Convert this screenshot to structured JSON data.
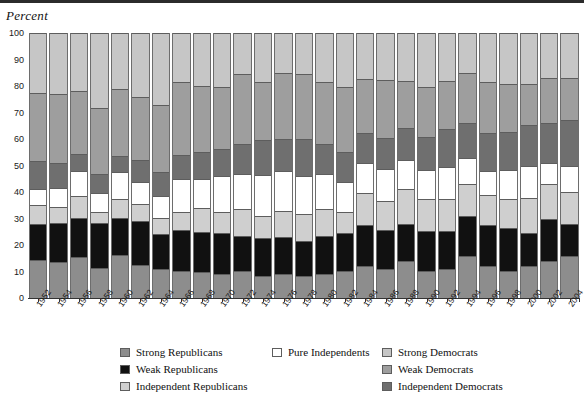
{
  "axis_title": "Percent",
  "legend": {
    "columns": [
      [
        {
          "label": "Strong Republicans",
          "key": "strong_republicans",
          "color": "#8d8d8d"
        },
        {
          "label": "Weak Republicans",
          "key": "weak_republicans",
          "color": "#111111"
        },
        {
          "label": "Independent Republicans",
          "key": "independent_republicans",
          "color": "#cfcfcf"
        }
      ],
      [
        {
          "label": "Pure Independents",
          "key": "pure_independents",
          "color": "#ffffff"
        }
      ],
      [
        {
          "label": "Strong Democrats",
          "key": "strong_democrats",
          "color": "#c6c6c6"
        },
        {
          "label": "Weak Democrats",
          "key": "weak_democrats",
          "color": "#9e9e9e"
        },
        {
          "label": "Independent Democrats",
          "key": "independent_democrats",
          "color": "#6f6f6f"
        }
      ]
    ]
  },
  "chart_data": {
    "type": "bar",
    "subtype": "stacked-100-percent",
    "title": "",
    "xlabel": "",
    "ylabel": "Percent",
    "ylim": [
      0,
      100
    ],
    "yticks": [
      0,
      10,
      20,
      30,
      40,
      50,
      60,
      70,
      80,
      90,
      100
    ],
    "grid": false,
    "legend_position": "bottom",
    "stack_order_bottom_to_top": [
      "strong_republicans",
      "weak_republicans",
      "independent_republicans",
      "pure_independents",
      "independent_democrats",
      "weak_democrats",
      "strong_democrats"
    ],
    "categories": [
      "1952",
      "1954",
      "1956",
      "1958",
      "1960",
      "1962",
      "1964",
      "1966",
      "1968",
      "1970",
      "1972",
      "1974",
      "1976",
      "1978",
      "1980",
      "1982",
      "1984",
      "1986",
      "1988",
      "1990",
      "1992",
      "1994",
      "1996",
      "1998",
      "2000",
      "2002",
      "2004"
    ],
    "series": [
      {
        "name": "Strong Republicans",
        "key": "strong_republicans",
        "color": "#8d8d8d",
        "values": [
          14,
          13,
          15,
          11,
          16,
          12,
          11,
          10,
          10,
          9,
          10,
          8,
          9,
          8,
          9,
          10,
          12,
          11,
          14,
          10,
          11,
          16,
          12,
          10,
          12,
          14,
          16
        ]
      },
      {
        "name": "Weak Republicans",
        "key": "weak_republicans",
        "color": "#111111",
        "values": [
          13,
          14,
          14,
          16,
          14,
          16,
          13,
          15,
          15,
          15,
          13,
          14,
          14,
          13,
          14,
          14,
          15,
          15,
          14,
          15,
          14,
          15,
          15,
          16,
          12,
          16,
          12
        ]
      },
      {
        "name": "Independent Republicans",
        "key": "independent_republicans",
        "color": "#cfcfcf",
        "values": [
          7,
          6,
          8,
          4,
          7,
          6,
          6,
          7,
          9,
          8,
          10,
          8,
          10,
          10,
          10,
          8,
          12,
          11,
          13,
          12,
          12,
          12,
          11,
          11,
          13,
          13,
          12
        ]
      },
      {
        "name": "Pure Independents",
        "key": "pure_independents",
        "color": "#ffffff",
        "values": [
          6,
          7,
          9,
          7,
          10,
          8,
          8,
          12,
          11,
          13,
          13,
          15,
          15,
          14,
          13,
          11,
          11,
          12,
          11,
          11,
          12,
          10,
          9,
          11,
          12,
          8,
          10
        ]
      },
      {
        "name": "Independent Democrats",
        "key": "independent_democrats",
        "color": "#6f6f6f",
        "values": [
          10,
          9,
          6,
          7,
          6,
          8,
          9,
          9,
          10,
          10,
          11,
          13,
          12,
          14,
          11,
          11,
          11,
          12,
          12,
          12,
          14,
          13,
          14,
          14,
          15,
          15,
          17
        ]
      },
      {
        "name": "Weak Democrats",
        "key": "weak_democrats",
        "color": "#9e9e9e",
        "values": [
          25,
          25,
          23,
          24,
          25,
          23,
          25,
          27,
          25,
          23,
          26,
          21,
          25,
          24,
          23,
          24,
          20,
          22,
          18,
          19,
          18,
          19,
          19,
          18,
          15,
          17,
          16
        ]
      },
      {
        "name": "Strong Democrats",
        "key": "strong_democrats",
        "color": "#c6c6c6",
        "values": [
          22,
          22,
          21,
          27,
          21,
          23,
          27,
          18,
          20,
          20,
          15,
          18,
          15,
          15,
          18,
          20,
          17,
          18,
          18,
          20,
          18,
          15,
          18,
          19,
          19,
          17,
          17
        ]
      }
    ]
  }
}
